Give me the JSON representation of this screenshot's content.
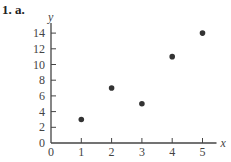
{
  "problem_label": "1. a.",
  "chart_data": {
    "type": "scatter",
    "title": "",
    "xlabel": "x",
    "ylabel": "y",
    "x": [
      1,
      2,
      3,
      4,
      5
    ],
    "y": [
      3,
      7,
      5,
      11,
      14
    ],
    "xlim": [
      0,
      5
    ],
    "ylim": [
      0,
      14
    ],
    "x_ticks": [
      0,
      1,
      2,
      3,
      4,
      5
    ],
    "y_ticks": [
      0,
      2,
      4,
      6,
      8,
      10,
      12,
      14
    ],
    "grid": false,
    "legend": null,
    "marker_color": "#333333"
  }
}
